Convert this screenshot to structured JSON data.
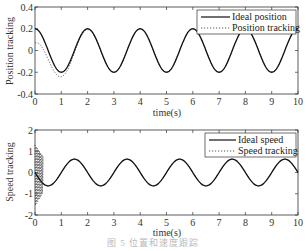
{
  "chart_data": [
    {
      "type": "line",
      "title": "",
      "xlabel": "time(s)",
      "ylabel": "Position tracking",
      "xlim": [
        0,
        10
      ],
      "ylim": [
        -0.4,
        0.4
      ],
      "xticks": [
        0,
        1,
        2,
        3,
        4,
        5,
        6,
        7,
        8,
        9,
        10
      ],
      "yticks": [
        -0.4,
        -0.2,
        0,
        0.2,
        0.4
      ],
      "ytick_labels": [
        "-0.4",
        "-0.2",
        "0",
        "0.2",
        "0.4"
      ],
      "grid": false,
      "legend_position": "upper right",
      "series": [
        {
          "name": "Ideal position",
          "style": "solid",
          "formula": "0.2*cos(pi*t)",
          "x": [
            0,
            0.5,
            1,
            1.5,
            2,
            2.5,
            3,
            3.5,
            4,
            4.5,
            5,
            5.5,
            6,
            6.5,
            7,
            7.5,
            8,
            8.5,
            9,
            9.5,
            10
          ],
          "values": [
            0.2,
            0,
            -0.2,
            0,
            0.2,
            0,
            -0.2,
            0,
            0.2,
            0,
            -0.2,
            0,
            0.2,
            0,
            -0.2,
            0,
            0.2,
            0,
            -0.2,
            0,
            0.2
          ]
        },
        {
          "name": "Position tracking",
          "style": "dotted",
          "x": [
            0,
            0.25,
            0.5,
            0.75,
            1,
            1.25,
            1.5,
            2,
            3,
            4,
            5,
            6,
            7,
            8,
            9,
            10
          ],
          "values": [
            0.08,
            0.03,
            -0.08,
            -0.2,
            -0.25,
            -0.17,
            -0.02,
            0.2,
            -0.2,
            0.2,
            -0.2,
            0.2,
            -0.2,
            0.2,
            -0.2,
            0.2
          ]
        }
      ]
    },
    {
      "type": "line",
      "title": "",
      "xlabel": "time(s)",
      "ylabel": "Speed tracking",
      "xlim": [
        0,
        10
      ],
      "ylim": [
        -2,
        2
      ],
      "xticks": [
        0,
        1,
        2,
        3,
        4,
        5,
        6,
        7,
        8,
        9,
        10
      ],
      "yticks": [
        -2,
        -1,
        0,
        1,
        2
      ],
      "ytick_labels": [
        "-2",
        "-1",
        "0",
        "1",
        "2"
      ],
      "grid": false,
      "legend_position": "upper right",
      "series": [
        {
          "name": "Ideal speed",
          "style": "solid",
          "formula": "-0.2*pi*sin(pi*t)",
          "x": [
            0,
            0.5,
            1,
            1.5,
            2,
            2.5,
            3,
            3.5,
            4,
            4.5,
            5,
            5.5,
            6,
            6.5,
            7,
            7.5,
            8,
            8.5,
            9,
            9.5,
            10
          ],
          "values": [
            0,
            -0.63,
            0,
            0.63,
            0,
            -0.63,
            0,
            0.63,
            0,
            -0.63,
            0,
            0.63,
            0,
            -0.63,
            0,
            0.63,
            0,
            -0.63,
            0,
            0.63,
            0
          ]
        },
        {
          "name": "Speed tracking",
          "style": "dotted",
          "note": "rapid chattering between about -1.6 and 1.3 for t in [0, 0.3], then follows ideal speed",
          "x": [
            0,
            0.3,
            0.5,
            1,
            1.5,
            2,
            3,
            4,
            5,
            6,
            7,
            8,
            9,
            10
          ],
          "values": [
            0,
            -0.5,
            -0.63,
            0,
            0.63,
            0,
            0,
            0,
            0,
            0,
            0,
            0,
            0,
            0
          ],
          "chatter_range": [
            -1.6,
            1.3
          ],
          "chatter_t": [
            0,
            0.3
          ]
        }
      ]
    }
  ],
  "caption": "图 5  位置和速度跟踪"
}
